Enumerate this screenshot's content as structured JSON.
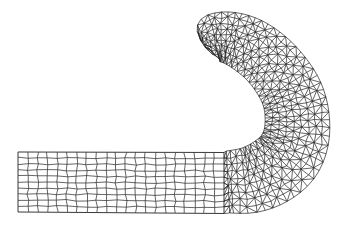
{
  "diagram": {
    "title": "",
    "colors": {
      "background": "#ffffff",
      "line": "#222222"
    },
    "regions": [
      {
        "name": "quad-strip",
        "element_type": "quadrilateral",
        "columns": 21,
        "rows": 10,
        "bounds": {
          "x0": 18,
          "y0": 152,
          "x1": 224,
          "y1": 213
        }
      },
      {
        "name": "hook",
        "element_type": "triangle",
        "outer_top": [
          218,
          14
        ],
        "outer_left": [
          186,
          50
        ],
        "outer_right": [
          318,
          117
        ],
        "inner_leftmost": [
          250,
          115
        ],
        "bottom_end": [
          224,
          215
        ]
      }
    ]
  }
}
